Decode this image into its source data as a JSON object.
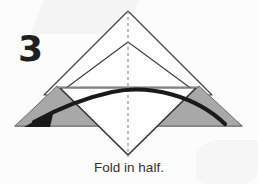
{
  "diagram": {
    "step_number": "3",
    "caption": "Fold in half.",
    "type": "origami-fold-instruction",
    "colors": {
      "background": "#fcfcfc",
      "outline": "#3c3c3c",
      "shaded_fill": "#a8a8a8",
      "shaded_stroke": "#6f6f6f",
      "arrow": "#1a1a1a",
      "crease_dash": "#9a9a9a",
      "number": "#201f1f",
      "caption": "#333333"
    },
    "shapes": {
      "upper_triangle": {
        "name": "upper-triangle",
        "points": "128,11 212,95 44,95",
        "fill": "#ffffff"
      },
      "wide_triangle": {
        "name": "wide-base-triangle",
        "points": "128,42 242,126 15,126",
        "fill": "#ffffff"
      },
      "lower_diamond_half": {
        "name": "lower-diamond-half",
        "points": "60,88 128,155 196,88",
        "fill": "#ffffff"
      },
      "left_shaded_flap": {
        "name": "left-shaded-flap",
        "points": "57,86 15,126 98,126",
        "fill": "#a8a8a8"
      },
      "right_shaded_flap": {
        "name": "right-shaded-flap",
        "points": "199,86 242,126 158,126",
        "fill": "#a8a8a8"
      },
      "horizontal_crease": {
        "name": "horizontal-crease-line",
        "from": [
          57,
          87
        ],
        "to": [
          199,
          87
        ]
      },
      "vertical_crease_dashed": {
        "name": "vertical-crease-dashed-line",
        "from": [
          128,
          11
        ],
        "to": [
          128,
          157
        ],
        "dash": "3 3"
      }
    },
    "arrow": {
      "name": "fold-direction-arrow",
      "direction": "right-to-left",
      "path": "M 225,124 C 196,96 150,84 112,92 C 80,99 52,112 34,122",
      "head_points": "26,126 52,112 48,126",
      "stroke_width": 4.2
    }
  }
}
